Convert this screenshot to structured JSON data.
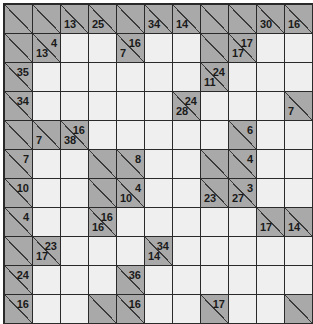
{
  "puzzle": {
    "type": "kakuro",
    "cols": 11,
    "rows": 11,
    "colors": {
      "clue": "#a9a9a9",
      "white": "#efefef",
      "line": "#2a2a2a"
    },
    "grid": [
      [
        {
          "t": "X"
        },
        {
          "t": "X"
        },
        {
          "t": "C",
          "d": 13
        },
        {
          "t": "C",
          "d": 25
        },
        {
          "t": "X"
        },
        {
          "t": "C",
          "d": 34
        },
        {
          "t": "C",
          "d": 14
        },
        {
          "t": "X"
        },
        {
          "t": "X"
        },
        {
          "t": "C",
          "d": 30
        },
        {
          "t": "C",
          "d": 16
        }
      ],
      [
        {
          "t": "X"
        },
        {
          "t": "C",
          "a": 4,
          "d": 13
        },
        {
          "t": "W"
        },
        {
          "t": "W"
        },
        {
          "t": "C",
          "a": 16,
          "d": 7
        },
        {
          "t": "W"
        },
        {
          "t": "W"
        },
        {
          "t": "X"
        },
        {
          "t": "C",
          "a": 17,
          "d": 17
        },
        {
          "t": "W"
        },
        {
          "t": "W"
        }
      ],
      [
        {
          "t": "C",
          "a": 35
        },
        {
          "t": "W"
        },
        {
          "t": "W"
        },
        {
          "t": "W"
        },
        {
          "t": "W"
        },
        {
          "t": "W"
        },
        {
          "t": "W"
        },
        {
          "t": "C",
          "a": 24,
          "d": 11
        },
        {
          "t": "W"
        },
        {
          "t": "W"
        },
        {
          "t": "W"
        }
      ],
      [
        {
          "t": "C",
          "a": 34
        },
        {
          "t": "W"
        },
        {
          "t": "W"
        },
        {
          "t": "W"
        },
        {
          "t": "W"
        },
        {
          "t": "W"
        },
        {
          "t": "C",
          "a": 24,
          "d": 28
        },
        {
          "t": "W"
        },
        {
          "t": "W"
        },
        {
          "t": "W"
        },
        {
          "t": "C",
          "d": 7
        }
      ],
      [
        {
          "t": "X"
        },
        {
          "t": "C",
          "d": 7
        },
        {
          "t": "C",
          "a": 16,
          "d": 38
        },
        {
          "t": "W"
        },
        {
          "t": "W"
        },
        {
          "t": "W"
        },
        {
          "t": "W"
        },
        {
          "t": "W"
        },
        {
          "t": "C",
          "a": 6
        },
        {
          "t": "W"
        },
        {
          "t": "W"
        }
      ],
      [
        {
          "t": "C",
          "a": 7
        },
        {
          "t": "W"
        },
        {
          "t": "W"
        },
        {
          "t": "X"
        },
        {
          "t": "C",
          "a": 8
        },
        {
          "t": "W"
        },
        {
          "t": "W"
        },
        {
          "t": "X"
        },
        {
          "t": "C",
          "a": 4
        },
        {
          "t": "W"
        },
        {
          "t": "W"
        }
      ],
      [
        {
          "t": "C",
          "a": 10
        },
        {
          "t": "W"
        },
        {
          "t": "W"
        },
        {
          "t": "X"
        },
        {
          "t": "C",
          "a": 4,
          "d": 10
        },
        {
          "t": "W"
        },
        {
          "t": "W"
        },
        {
          "t": "C",
          "d": 23
        },
        {
          "t": "C",
          "a": 3,
          "d": 27
        },
        {
          "t": "W"
        },
        {
          "t": "W"
        }
      ],
      [
        {
          "t": "C",
          "a": 4
        },
        {
          "t": "W"
        },
        {
          "t": "W"
        },
        {
          "t": "C",
          "a": 16,
          "d": 16
        },
        {
          "t": "W"
        },
        {
          "t": "W"
        },
        {
          "t": "W"
        },
        {
          "t": "W"
        },
        {
          "t": "W"
        },
        {
          "t": "C",
          "d": 17
        },
        {
          "t": "C",
          "d": 14
        }
      ],
      [
        {
          "t": "X"
        },
        {
          "t": "C",
          "a": 23,
          "d": 17
        },
        {
          "t": "W"
        },
        {
          "t": "W"
        },
        {
          "t": "W"
        },
        {
          "t": "C",
          "a": 34,
          "d": 14
        },
        {
          "t": "W"
        },
        {
          "t": "W"
        },
        {
          "t": "W"
        },
        {
          "t": "W"
        },
        {
          "t": "W"
        }
      ],
      [
        {
          "t": "C",
          "a": 24
        },
        {
          "t": "W"
        },
        {
          "t": "W"
        },
        {
          "t": "W"
        },
        {
          "t": "C",
          "a": 36
        },
        {
          "t": "W"
        },
        {
          "t": "W"
        },
        {
          "t": "W"
        },
        {
          "t": "W"
        },
        {
          "t": "W"
        },
        {
          "t": "W"
        }
      ],
      [
        {
          "t": "C",
          "a": 16
        },
        {
          "t": "W"
        },
        {
          "t": "W"
        },
        {
          "t": "X"
        },
        {
          "t": "C",
          "a": 16
        },
        {
          "t": "W"
        },
        {
          "t": "W"
        },
        {
          "t": "C",
          "a": 17
        },
        {
          "t": "W"
        },
        {
          "t": "W"
        },
        {
          "t": "X"
        }
      ]
    ]
  }
}
